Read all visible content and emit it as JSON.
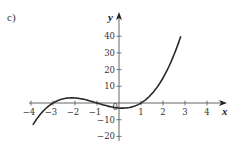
{
  "part_label": "c)",
  "chart_data": {
    "type": "line",
    "title": "",
    "xlabel": "x",
    "ylabel": "y",
    "function": "y = x^3 + 3x^2 - x - 3 = (x+3)(x+1)(x-1)",
    "xlim": [
      -4.2,
      4.9
    ],
    "ylim": [
      -22,
      54
    ],
    "x_ticks": [
      -4,
      -3,
      -2,
      -1,
      0,
      1,
      2,
      3,
      4
    ],
    "x_tick_labels": [
      "−4",
      "−3",
      "−2",
      "−1",
      "0",
      "1",
      "2",
      "3",
      "4"
    ],
    "y_ticks": [
      -20,
      -10,
      10,
      20,
      30,
      40
    ],
    "y_tick_labels": [
      "−20",
      "−10",
      "10",
      "20",
      "30",
      "40"
    ],
    "grid": false,
    "legend": null,
    "series": [
      {
        "name": "f(x)",
        "x": [
          -3.9,
          -3.5,
          -3,
          -2.5,
          -2.1,
          -2,
          -1.5,
          -1,
          -0.5,
          0,
          0.2,
          0.5,
          1,
          1.5,
          2,
          2.5,
          2.8
        ],
        "values": [
          -12.8,
          -5.6,
          0,
          2.6,
          3.1,
          3,
          1.9,
          0,
          -1.9,
          -3,
          -3.1,
          -2.6,
          0,
          5.6,
          15,
          29.4,
          39.7
        ]
      }
    ],
    "key_points": {
      "roots": [
        -3,
        -1,
        1
      ],
      "local_max": [
        -2.15,
        3.1
      ],
      "local_min": [
        0.15,
        -3.1
      ],
      "y_intercept": -3
    }
  }
}
